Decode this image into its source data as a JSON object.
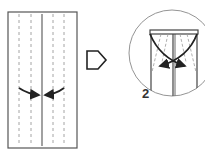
{
  "diagram": {
    "type": "origami-instructions",
    "colors": {
      "line": "#444444",
      "dashed": "#9a9a9a",
      "arrow": "#222222",
      "background": "#ffffff"
    },
    "panels": [
      {
        "name": "step-1",
        "description": "Rectangle sheet with vertical center line and valley-fold dashed lines; curved arrows fold outer edges to the center"
      },
      {
        "name": "next-step-arrow",
        "icon": "hollow-right-arrow"
      },
      {
        "name": "step-2-detail",
        "description": "Circular zoomed detail showing top corners folded diagonally with crossing curved arrows",
        "label": "2"
      }
    ]
  }
}
